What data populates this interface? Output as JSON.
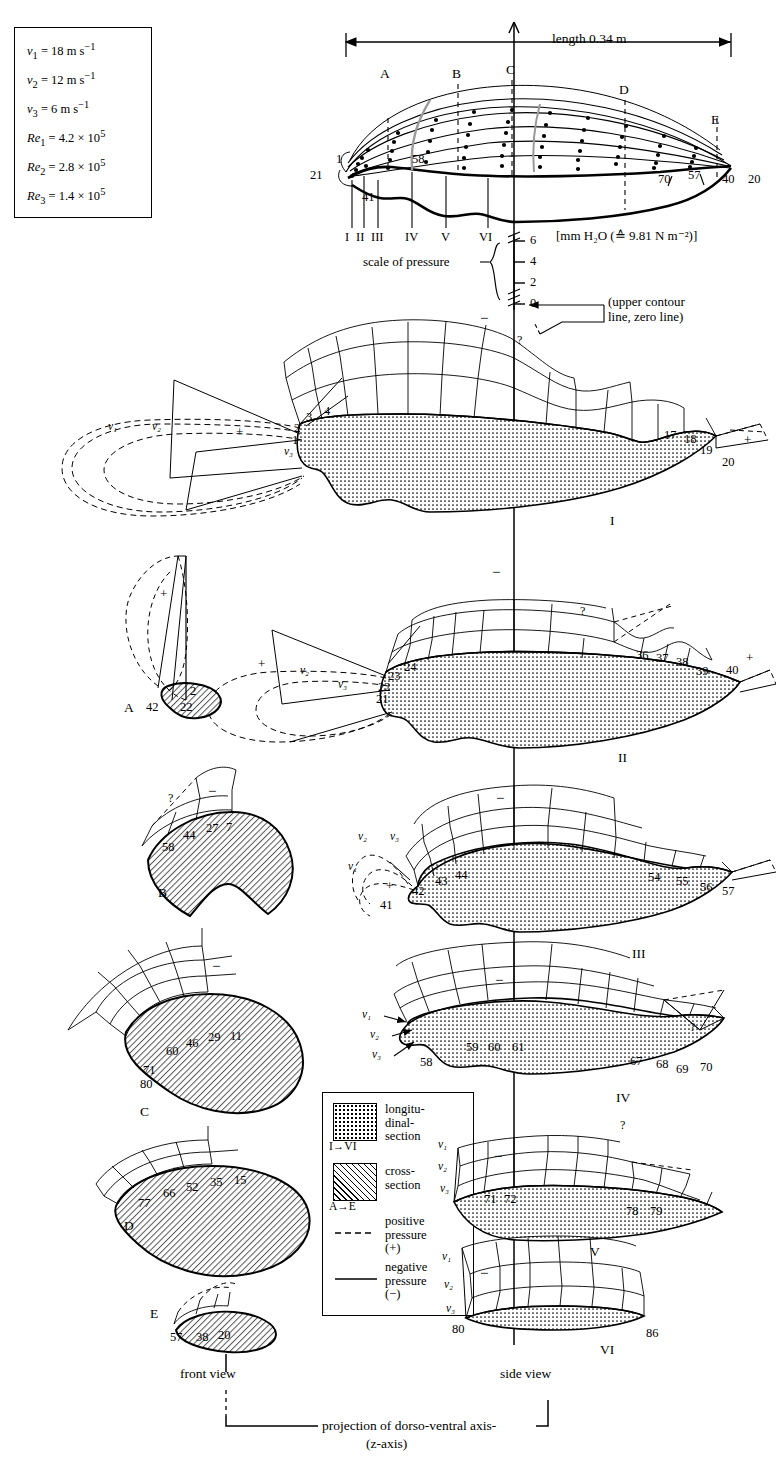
{
  "figure": {
    "type": "pressure-distribution-diagram",
    "length_label": "length 0.34 m",
    "pressure_unit_label": "[mm H₂O (≙ 9.81 N m⁻²)]",
    "scale_label_line1": "scale of pressure",
    "zero_note_line1": "(upper contour",
    "zero_note_line2": "line, zero line)",
    "front_view_label": "front view",
    "side_view_label": "side view",
    "axis_caption_line1": "projection of dorso-ventral axis-",
    "axis_caption_line2": "(z-axis)"
  },
  "parameters": {
    "rows": [
      {
        "sym": "v",
        "sub": "1",
        "eq": "= 18 m s",
        "sup": "−1"
      },
      {
        "sym": "v",
        "sub": "2",
        "eq": "= 12 m s",
        "sup": "−1"
      },
      {
        "sym": "v",
        "sub": "3",
        "eq": "= 6 m s",
        "sup": "−1"
      },
      {
        "sym": "Re",
        "sub": "1",
        "eq": "= 4.2 × 10",
        "sup": "5"
      },
      {
        "sym": "Re",
        "sub": "2",
        "eq": "= 2.8 × 10",
        "sup": "5"
      },
      {
        "sym": "Re",
        "sub": "3",
        "eq": "= 1.4 × 10",
        "sup": "5"
      }
    ]
  },
  "pressure_scale": {
    "ticks": [
      "6",
      "4",
      "2",
      "0"
    ],
    "unit": "mm H₂O"
  },
  "legend": {
    "items": [
      {
        "swatch": "dotted",
        "text_line1": "longitu-",
        "text_line2": "dinal-",
        "text_line3": "section",
        "range": "I→VI"
      },
      {
        "swatch": "hatched",
        "text_line1": "cross-",
        "text_line2": "section",
        "text_line3": "",
        "range": "A→E"
      },
      {
        "swatch": "dashed-line",
        "text_line1": "positive",
        "text_line2": "pressure",
        "text_line3": "(+)",
        "range": ""
      },
      {
        "swatch": "solid-line",
        "text_line1": "negative",
        "text_line2": "pressure",
        "text_line3": "(−)",
        "range": ""
      }
    ]
  },
  "overview": {
    "cross_section_markers": [
      "A",
      "B",
      "C",
      "D",
      "E"
    ],
    "longitudinal_markers": [
      "I",
      "II",
      "III",
      "IV",
      "V",
      "VI"
    ],
    "tap_labels_left": [
      "1",
      "21",
      "41",
      "58"
    ],
    "tap_labels_right": [
      "70",
      "57",
      "40",
      "20"
    ]
  },
  "sections": {
    "longitudinal": [
      {
        "name": "I",
        "front_taps": [
          "1",
          "2",
          "3",
          "4"
        ],
        "rear_taps": [
          "17",
          "18",
          "19",
          "20"
        ],
        "velocity_labels": [
          "v₁",
          "v₂",
          "v₃"
        ],
        "plus_marker": "+",
        "minus_marker": "−",
        "query_marker": "?"
      },
      {
        "name": "II",
        "front_taps": [
          "21",
          "22",
          "23",
          "24"
        ],
        "rear_taps": [
          "36",
          "37",
          "38",
          "39",
          "40"
        ],
        "velocity_labels": [
          "v₂",
          "v₃"
        ],
        "plus_marker": "+",
        "minus_marker": "−",
        "query_marker": "?"
      },
      {
        "name": "III",
        "front_taps": [
          "41",
          "42",
          "43",
          "44"
        ],
        "rear_taps": [
          "54",
          "55",
          "56",
          "57"
        ],
        "velocity_labels": [
          "v₁",
          "v₂",
          "v₃"
        ],
        "plus_marker": "+",
        "minus_marker": "−",
        "query_marker": "?"
      },
      {
        "name": "IV",
        "front_taps": [
          "58",
          "59",
          "60",
          "61"
        ],
        "rear_taps": [
          "67",
          "68",
          "69",
          "70"
        ],
        "velocity_labels": [
          "v₁",
          "v₂",
          "v₃"
        ],
        "plus_marker": "",
        "minus_marker": "−",
        "query_marker": "?"
      },
      {
        "name": "V",
        "front_taps": [
          "71",
          "72"
        ],
        "rear_taps": [
          "78",
          "79"
        ],
        "velocity_labels": [
          "v₁",
          "v₂",
          "v₃"
        ],
        "plus_marker": "",
        "minus_marker": "−",
        "query_marker": "?"
      },
      {
        "name": "VI",
        "front_taps": [
          "80"
        ],
        "rear_taps": [
          "86"
        ],
        "velocity_labels": [
          "v₁",
          "v₂",
          "v₃"
        ],
        "plus_marker": "",
        "minus_marker": "−",
        "query_marker": ""
      }
    ],
    "cross": [
      {
        "name": "A",
        "taps": [
          "42",
          "22",
          "2"
        ],
        "plus_marker": "+",
        "minus_marker": ""
      },
      {
        "name": "B",
        "taps": [
          "58",
          "44",
          "27",
          "7"
        ],
        "plus_marker": "",
        "minus_marker": "−",
        "query_marker": "?"
      },
      {
        "name": "C",
        "taps": [
          "80",
          "71",
          "60",
          "46",
          "29",
          "11"
        ],
        "plus_marker": "",
        "minus_marker": "−"
      },
      {
        "name": "D",
        "taps": [
          "77",
          "66",
          "52",
          "35",
          "15"
        ],
        "plus_marker": "",
        "minus_marker": "−"
      },
      {
        "name": "E",
        "taps": [
          "57",
          "38",
          "20"
        ],
        "plus_marker": "",
        "minus_marker": ""
      }
    ]
  },
  "colors": {
    "ink": "#000000",
    "paper": "#ffffff",
    "fill_dotted": "#ffffff",
    "fill_hatched": "#d9d9d9"
  }
}
